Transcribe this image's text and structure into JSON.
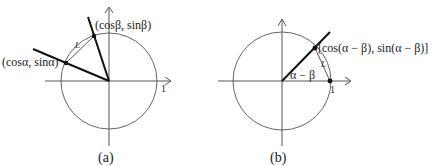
{
  "figure_a": {
    "caption": "(a)",
    "point_alpha_label": "(cosα, sinα)",
    "point_beta_label": "(cosβ, sinβ)",
    "chord_label": "L",
    "unit_label": "1"
  },
  "figure_b": {
    "caption": "(b)",
    "point_label": "[cos(α − β), sin(α − β)]",
    "angle_label": "α − β",
    "chord_label": "L",
    "unit_label": "1"
  },
  "colors": {
    "stroke": "#222222",
    "circle": "#555555",
    "background": "#ffffff"
  }
}
